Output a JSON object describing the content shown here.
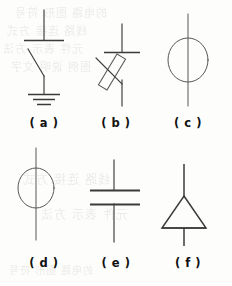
{
  "figure": {
    "width": 232,
    "height": 286,
    "background_color": "#fdfdfc",
    "ink_color": "#3b3b3b",
    "caption_color": "#111111",
    "columns": 3,
    "rows": 2
  },
  "panels": [
    {
      "id": "panel-a",
      "caption": "( a )",
      "symbol_name": "switch-to-ground",
      "description": "Vertical lead with horizontal terminal bar, open knife switch blade, and earth ground symbol",
      "x": 8,
      "y": 6,
      "width": 72,
      "height": 104
    },
    {
      "id": "panel-b",
      "caption": "( b )",
      "symbol_name": "fuse-inclined",
      "description": "Vertical lead with horizontal terminal bar above an inclined elongated fuse element",
      "x": 82,
      "y": 6,
      "width": 68,
      "height": 104
    },
    {
      "id": "panel-c",
      "caption": "( c )",
      "symbol_name": "circle-on-line-large",
      "description": "Large circle bisected by a vertical line",
      "x": 152,
      "y": 6,
      "width": 72,
      "height": 104
    },
    {
      "id": "panel-d",
      "caption": "( d )",
      "symbol_name": "circle-on-line-small",
      "description": "Circle bisected by a vertical line, circle set high on the lead",
      "x": 8,
      "y": 146,
      "width": 72,
      "height": 104
    },
    {
      "id": "panel-e",
      "caption": "( e )",
      "symbol_name": "capacitor",
      "description": "Two parallel horizontal plates with vertical leads above and below",
      "x": 82,
      "y": 146,
      "width": 68,
      "height": 104
    },
    {
      "id": "panel-f",
      "caption": "( f )",
      "symbol_name": "triangle-on-line",
      "description": "Upward pointing triangle with a vertical line passing through its apex and base",
      "x": 152,
      "y": 146,
      "width": 72,
      "height": 104
    }
  ],
  "captions": {
    "a": "( a )",
    "b": "( b )",
    "c": "( c )",
    "d": "( d )",
    "e": "( e )",
    "f": "( f )"
  },
  "ghost_text": {
    "note": "faint illegible show-through text from the reverse side of the scanned page",
    "lines": [
      "的电路 图形 符号",
      "线路 连接 方式",
      "元件 表示 方法",
      "图例 说明 文字"
    ]
  }
}
